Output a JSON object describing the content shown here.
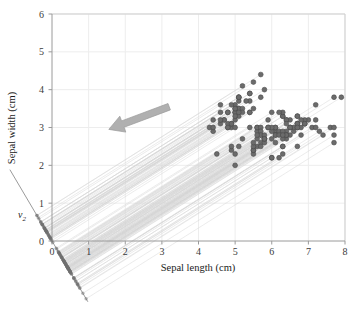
{
  "figure": {
    "axis_x_title": "Sepal length (cm)",
    "axis_y_title": "Sepal width (cm)",
    "projection_axis_label": "v",
    "projection_axis_subscript": "2",
    "arrow_name": "projection-direction-arrow",
    "caption": "",
    "colors": {
      "point_fill": "#6b6b6b",
      "point_edge": "#4a4a4a",
      "grid": "#ededed",
      "border": "#cfcfcf",
      "projection_line": "#d6d6d6",
      "axis_line": "#9a9a9a",
      "arrow": "#b0b0b0",
      "text": "#1c1c1c"
    }
  },
  "chart_data": {
    "type": "scatter",
    "title": "",
    "xlabel": "Sepal length (cm)",
    "ylabel": "Sepal width (cm)",
    "xlim": [
      0,
      8
    ],
    "ylim": [
      0,
      6
    ],
    "xticks": [
      0,
      1,
      2,
      3,
      4,
      5,
      6,
      7,
      8
    ],
    "yticks": [
      0,
      1,
      2,
      3,
      4,
      5,
      6
    ],
    "grid": true,
    "legend": null,
    "annotations": [
      {
        "type": "arrow",
        "label": "",
        "from_x": 3.2,
        "from_y": 3.55,
        "to_x": 1.55,
        "to_y": 2.95
      },
      {
        "type": "axis-label",
        "label": "v2",
        "x": -0.55,
        "y": 1.02
      }
    ],
    "projection_axis": {
      "label": "v2",
      "slope": -1.64,
      "intercept": 0,
      "x_from": -1.15,
      "x_to": 0.98,
      "description": "second principal direction; data projected onto this line"
    },
    "projection_lines": {
      "visible": true,
      "slope": 0.61,
      "count": 150,
      "description": "faint parallel lines from each data point to its projection on the v2 axis"
    },
    "series": [
      {
        "name": "iris samples",
        "marker": "circle",
        "x": [
          5.1,
          4.9,
          4.7,
          4.6,
          5.0,
          5.4,
          4.6,
          5.0,
          4.4,
          4.9,
          5.4,
          4.8,
          4.8,
          4.3,
          5.8,
          5.7,
          5.4,
          5.1,
          5.7,
          5.1,
          5.4,
          5.1,
          4.6,
          5.1,
          4.8,
          5.0,
          5.0,
          5.2,
          5.2,
          4.7,
          4.8,
          5.4,
          5.2,
          5.5,
          4.9,
          5.0,
          5.5,
          4.9,
          4.4,
          5.1,
          5.0,
          4.5,
          4.4,
          5.0,
          5.1,
          4.8,
          5.1,
          4.6,
          5.3,
          5.0,
          7.0,
          6.4,
          6.9,
          5.5,
          6.5,
          5.7,
          6.3,
          4.9,
          6.6,
          5.2,
          5.0,
          5.9,
          6.0,
          6.1,
          5.6,
          6.7,
          5.6,
          5.8,
          6.2,
          5.6,
          5.9,
          6.1,
          6.3,
          6.1,
          6.4,
          6.6,
          6.8,
          6.7,
          6.0,
          5.7,
          5.5,
          5.5,
          5.8,
          6.0,
          5.4,
          6.0,
          6.7,
          6.3,
          5.6,
          5.5,
          5.5,
          6.1,
          5.8,
          5.0,
          5.6,
          5.7,
          5.7,
          6.2,
          5.1,
          5.7,
          6.3,
          5.8,
          7.1,
          6.3,
          6.5,
          7.6,
          4.9,
          7.3,
          6.7,
          7.2,
          6.5,
          6.4,
          6.8,
          5.7,
          5.8,
          6.4,
          6.5,
          7.7,
          7.7,
          6.0,
          6.9,
          5.6,
          7.7,
          6.3,
          6.7,
          7.2,
          6.2,
          6.1,
          6.4,
          7.2,
          7.4,
          7.9,
          6.4,
          6.3,
          6.1,
          7.7,
          6.3,
          6.4,
          6.0,
          6.9,
          6.7,
          6.9,
          5.8,
          6.8,
          6.7,
          6.7,
          6.3,
          6.5,
          6.2,
          5.9
        ],
        "y": [
          3.5,
          3.0,
          3.2,
          3.1,
          3.6,
          3.9,
          3.4,
          3.4,
          2.9,
          3.1,
          3.7,
          3.4,
          3.0,
          3.0,
          4.0,
          4.4,
          3.9,
          3.5,
          3.8,
          3.8,
          3.4,
          3.7,
          3.6,
          3.3,
          3.4,
          3.0,
          3.4,
          3.5,
          3.4,
          3.2,
          3.1,
          3.4,
          4.1,
          4.2,
          3.1,
          3.2,
          3.5,
          3.6,
          3.0,
          3.4,
          3.5,
          2.3,
          3.2,
          3.5,
          3.8,
          3.0,
          3.8,
          3.2,
          3.7,
          3.3,
          3.2,
          3.2,
          3.1,
          2.3,
          2.8,
          2.8,
          3.3,
          2.4,
          2.9,
          2.7,
          2.0,
          3.0,
          2.2,
          2.9,
          2.9,
          3.1,
          3.0,
          2.7,
          2.2,
          2.5,
          3.2,
          2.8,
          2.5,
          2.8,
          2.9,
          3.0,
          2.8,
          3.0,
          2.9,
          2.6,
          2.4,
          2.4,
          2.7,
          2.7,
          3.0,
          3.4,
          3.1,
          2.3,
          3.0,
          2.5,
          2.6,
          3.0,
          2.6,
          2.3,
          2.7,
          3.0,
          2.9,
          2.9,
          2.5,
          2.8,
          3.3,
          2.7,
          3.0,
          2.9,
          3.0,
          3.0,
          2.5,
          2.9,
          2.5,
          3.6,
          3.2,
          2.7,
          3.0,
          2.5,
          2.8,
          3.2,
          3.0,
          3.8,
          2.6,
          2.2,
          3.2,
          2.8,
          2.8,
          2.7,
          3.3,
          3.2,
          2.8,
          3.0,
          2.8,
          3.0,
          2.8,
          3.8,
          2.8,
          2.8,
          2.6,
          3.0,
          3.4,
          3.1,
          3.0,
          3.1,
          3.1,
          3.1,
          2.7,
          3.2,
          3.3,
          3.0,
          2.5,
          3.0,
          3.4,
          3.0
        ]
      }
    ]
  }
}
